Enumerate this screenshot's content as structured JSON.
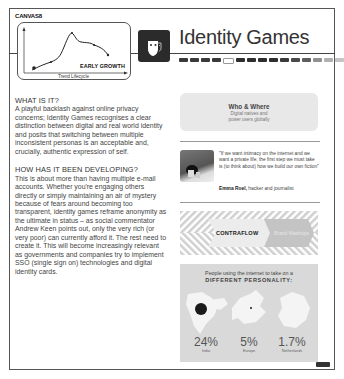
{
  "header": {
    "brand": "CANVAS8",
    "title": "Identity Games",
    "icon": "theatre-mask-icon",
    "progress_segments": [
      "#3a3a3a",
      "#3a3a3a",
      "#3a3a3a",
      "#3a3a3a",
      "#ffffff",
      "#2e2e2e",
      "#2e2e2e",
      "#2e2e2e",
      "#2e2e2e",
      "#3a3a3a",
      "#4a4a4a",
      "#5e5e5e",
      "#909090",
      "#b0b0b0",
      "#c4c4c4"
    ]
  },
  "chart": {
    "stage_label": "EARLY GROWTH",
    "x_axis_label": "Trend Lifecycle"
  },
  "chart_data": {
    "type": "line",
    "title": "",
    "xlabel": "Trend Lifecycle",
    "ylabel": "",
    "annotations": [
      "EARLY GROWTH"
    ],
    "x": [
      0,
      1,
      2,
      3,
      4,
      5
    ],
    "values": [
      1,
      2,
      6,
      4,
      3.5,
      2.5
    ],
    "highlight_index": 0,
    "grid": false
  },
  "article": {
    "section1_heading": "WHAT IS IT?",
    "section1_body": "A playful backlash against online privacy concerns; Identity Games recognises a clear distinction between digital and real world identity and posits that switching between multiple inconsistent personas is an acceptable and, crucially, authentic expression of self.",
    "section2_heading": "HOW HAS IT BEEN DEVELOPING?",
    "section2_body": "This is about more than having multiple e-mail accounts. Whether you're engaging others directly or simply maintaining an air of mystery because of fears around becoming too transparent, identity games reframe anonymity as the ultimate in status – as social commentator Andrew Keen points out, only the very rich (or very poor) can currently afford it. The rest need to create it. This will become increasingly relevant as governments and companies try to implement SSO (single sign on) technologies and digital identity cards."
  },
  "who_where": {
    "heading": "Who & Where",
    "line1": "Digital natives and",
    "line2": "power users globally"
  },
  "quote": {
    "text": "\"If we want intimacy on the internet and we want a private life, the first step we must take is (to think about) how we build our own fiction\"",
    "author_name": "Emma Roel,",
    "author_role": "hacker and journalist"
  },
  "flow": {
    "left_label": "CONTRAFLOW",
    "right_label": "Brand Mashups"
  },
  "map": {
    "line1": "People using the internet to take on a",
    "line2": "DIFFERENT PERSONALITY:",
    "stats": [
      {
        "value": "24%",
        "label": "India"
      },
      {
        "value": "5%",
        "label": "Europe"
      },
      {
        "value": "1.7%",
        "label": "Netherlands"
      }
    ]
  }
}
